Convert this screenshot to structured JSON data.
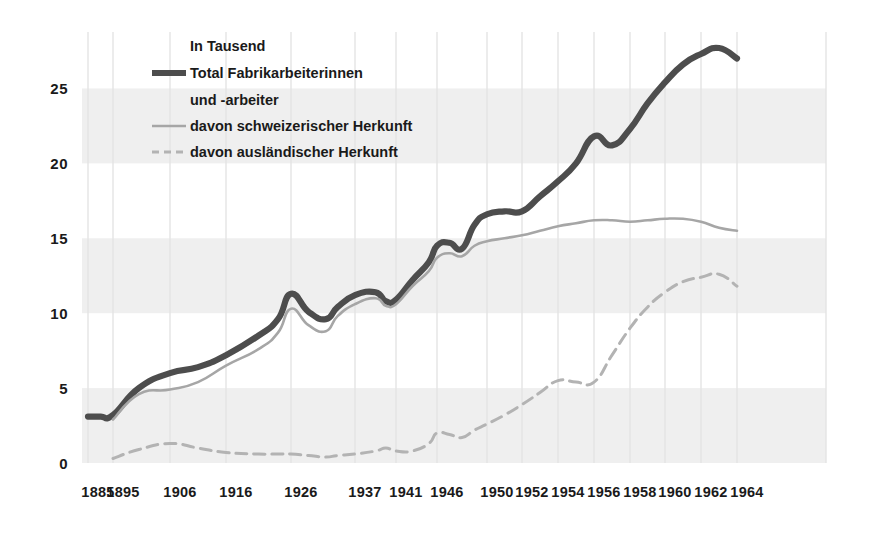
{
  "chart_data": {
    "type": "line",
    "title": "",
    "subtitle": "",
    "unit_note": "In Tausend",
    "xlabel": "",
    "ylabel": "",
    "ylim": [
      0,
      28.5
    ],
    "yticks": [
      0,
      5,
      10,
      15,
      20,
      25
    ],
    "grid": "horizontal alternating gray bands (0-5, 10-15, 20-25) plus faint vertical year gridlines",
    "legend_position": "top-left inside plot",
    "x_tick_labels": [
      "1885",
      "1895",
      "1906",
      "1916",
      "1926",
      "1937",
      "1941",
      "1946",
      "1950",
      "1952",
      "1954",
      "1956",
      "1958",
      "1960",
      "1962",
      "1964"
    ],
    "x_tick_values": [
      1885,
      1895,
      1906,
      1916,
      1926,
      1937,
      1941,
      1946,
      1950,
      1952,
      1954,
      1956,
      1958,
      1960,
      1962,
      1964
    ],
    "x_axis_note": "non-linear ordinal spacing: early years widely spaced, post-1950 biennial ticks evenly spaced",
    "series": [
      {
        "name": "Total Fabrikarbeiterinnen und -arbeiter",
        "legend_label_line1": "Total Fabrikarbeiterinnen",
        "legend_label_line2": "und -arbeiter",
        "style": "solid-thick",
        "color": "#4d4d4d",
        "points": [
          [
            1885,
            3.1
          ],
          [
            1890,
            3.1
          ],
          [
            1895,
            3.2
          ],
          [
            1900,
            5.0
          ],
          [
            1906,
            6.0
          ],
          [
            1911,
            6.4
          ],
          [
            1916,
            7.2
          ],
          [
            1921,
            8.5
          ],
          [
            1924,
            9.6
          ],
          [
            1926,
            11.3
          ],
          [
            1929,
            10.1
          ],
          [
            1932,
            9.6
          ],
          [
            1934,
            10.4
          ],
          [
            1937,
            11.2
          ],
          [
            1939,
            11.4
          ],
          [
            1940,
            10.8
          ],
          [
            1941,
            10.9
          ],
          [
            1943,
            12.2
          ],
          [
            1945,
            13.4
          ],
          [
            1946,
            14.5
          ],
          [
            1947,
            14.7
          ],
          [
            1948,
            14.3
          ],
          [
            1949,
            15.9
          ],
          [
            1950,
            16.6
          ],
          [
            1951,
            16.8
          ],
          [
            1952,
            16.8
          ],
          [
            1953,
            17.8
          ],
          [
            1954,
            18.8
          ],
          [
            1955,
            20.0
          ],
          [
            1956,
            21.8
          ],
          [
            1957,
            21.2
          ],
          [
            1958,
            22.3
          ],
          [
            1959,
            24.0
          ],
          [
            1960,
            25.4
          ],
          [
            1961,
            26.6
          ],
          [
            1962,
            27.3
          ],
          [
            1963,
            27.7
          ],
          [
            1964,
            27.0
          ]
        ]
      },
      {
        "name": "davon schweizerischer Herkunft",
        "legend_label_line1": "davon schweizerischer Herkunft",
        "style": "solid-thin",
        "color": "#a6a6a6",
        "points": [
          [
            1895,
            2.9
          ],
          [
            1900,
            4.6
          ],
          [
            1906,
            4.9
          ],
          [
            1911,
            5.4
          ],
          [
            1916,
            6.5
          ],
          [
            1921,
            7.6
          ],
          [
            1924,
            8.7
          ],
          [
            1926,
            10.3
          ],
          [
            1929,
            9.2
          ],
          [
            1932,
            8.8
          ],
          [
            1934,
            9.8
          ],
          [
            1937,
            10.6
          ],
          [
            1939,
            11.0
          ],
          [
            1940,
            10.5
          ],
          [
            1941,
            10.6
          ],
          [
            1943,
            11.8
          ],
          [
            1945,
            12.8
          ],
          [
            1946,
            13.7
          ],
          [
            1947,
            14.0
          ],
          [
            1948,
            13.8
          ],
          [
            1949,
            14.5
          ],
          [
            1950,
            14.8
          ],
          [
            1951,
            15.0
          ],
          [
            1952,
            15.2
          ],
          [
            1953,
            15.5
          ],
          [
            1954,
            15.8
          ],
          [
            1955,
            16.0
          ],
          [
            1956,
            16.2
          ],
          [
            1957,
            16.2
          ],
          [
            1958,
            16.1
          ],
          [
            1959,
            16.2
          ],
          [
            1960,
            16.3
          ],
          [
            1961,
            16.3
          ],
          [
            1962,
            16.1
          ],
          [
            1963,
            15.7
          ],
          [
            1964,
            15.5
          ]
        ]
      },
      {
        "name": "davon ausländischer Herkunft",
        "legend_label_line1": "davon ausländischer Herkunft",
        "style": "dashed",
        "color": "#b3b3b3",
        "points": [
          [
            1895,
            0.3
          ],
          [
            1900,
            0.9
          ],
          [
            1906,
            1.3
          ],
          [
            1911,
            1.0
          ],
          [
            1916,
            0.7
          ],
          [
            1921,
            0.6
          ],
          [
            1924,
            0.6
          ],
          [
            1926,
            0.6
          ],
          [
            1929,
            0.5
          ],
          [
            1932,
            0.4
          ],
          [
            1934,
            0.5
          ],
          [
            1937,
            0.6
          ],
          [
            1939,
            0.8
          ],
          [
            1940,
            1.0
          ],
          [
            1941,
            0.8
          ],
          [
            1943,
            0.8
          ],
          [
            1945,
            1.3
          ],
          [
            1946,
            2.0
          ],
          [
            1947,
            1.9
          ],
          [
            1948,
            1.7
          ],
          [
            1949,
            2.2
          ],
          [
            1950,
            2.6
          ],
          [
            1951,
            3.2
          ],
          [
            1952,
            3.9
          ],
          [
            1953,
            4.7
          ],
          [
            1954,
            5.5
          ],
          [
            1955,
            5.4
          ],
          [
            1956,
            5.4
          ],
          [
            1957,
            7.2
          ],
          [
            1958,
            9.0
          ],
          [
            1959,
            10.4
          ],
          [
            1960,
            11.4
          ],
          [
            1961,
            12.1
          ],
          [
            1962,
            12.4
          ],
          [
            1963,
            12.6
          ],
          [
            1964,
            11.8
          ]
        ]
      }
    ]
  },
  "legend": {
    "unit": "In Tausend",
    "items": [
      {
        "label": "Total Fabrikarbeiterinnen",
        "label2": "und -arbeiter",
        "swatch": "solid-thick"
      },
      {
        "label": "davon schweizerischer Herkunft",
        "swatch": "solid-thin"
      },
      {
        "label": "davon ausländischer Herkunft",
        "swatch": "dashed"
      }
    ]
  },
  "colors": {
    "total": "#4d4d4d",
    "swiss": "#a6a6a6",
    "foreign": "#b3b3b3",
    "band": "#efefef",
    "gridline": "#e4e4e4",
    "text": "#1a1a1a",
    "background": "#ffffff"
  }
}
